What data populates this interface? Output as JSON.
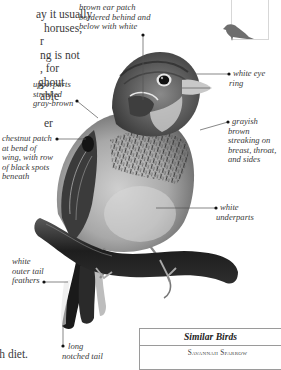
{
  "page": {
    "body_text_lines": [
      "ay it usually",
      "horuses,",
      "r",
      "ng is not",
      ", for",
      "ghout",
      "able",
      "",
      "er"
    ],
    "footer_text": "ough diet."
  },
  "figure": {
    "callouts": [
      {
        "id": "ear-patch",
        "lines": [
          "brown ear patch",
          "bordered behind and",
          "below with white"
        ]
      },
      {
        "id": "eye-ring",
        "lines": [
          "white eye",
          "ring"
        ]
      },
      {
        "id": "upperparts",
        "lines": [
          "upperparts",
          "streaked",
          "gray-brown"
        ]
      },
      {
        "id": "chestnut-patch",
        "lines": [
          "chestnut patch",
          "at bend of",
          "wing, with row",
          "of black spots",
          "beneath"
        ]
      },
      {
        "id": "breast-streaking",
        "lines": [
          "grayish",
          "brown",
          "streaking on",
          "breast, throat,",
          "and sides"
        ]
      },
      {
        "id": "underparts",
        "lines": [
          "white",
          "underparts"
        ]
      },
      {
        "id": "outer-tail",
        "lines": [
          "white",
          "outer tail",
          "feathers"
        ]
      },
      {
        "id": "tail",
        "lines": [
          "long",
          "notched tail"
        ]
      }
    ]
  },
  "thumbnail": {
    "icon": "bird-silhouette-icon",
    "color": "#6e6e6e"
  },
  "similar_birds": {
    "title": "Similar Birds",
    "items": [
      "Savannah Sparrow"
    ]
  },
  "colors": {
    "text": "#3a3a3a",
    "callout_line": "#555555",
    "box_border": "#9a9a9a"
  }
}
